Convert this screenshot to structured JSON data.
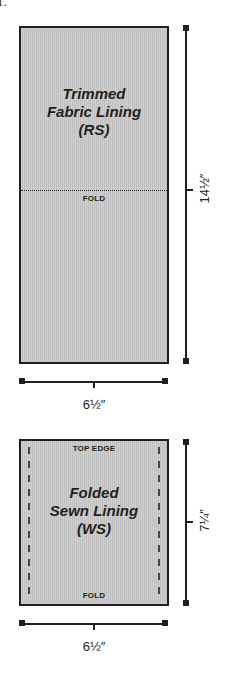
{
  "corner_fragment": "1.",
  "top_panel": {
    "title_lines": [
      "Trimmed",
      "Fabric Lining",
      "(RS)"
    ],
    "fold_label": "FOLD",
    "fill_color": "#c9c9c9",
    "border_color": "#231f20"
  },
  "top_dimensions": {
    "height_label": "14½″",
    "width_label": "6½″"
  },
  "bottom_panel": {
    "title_lines": [
      "Folded",
      "Sewn Lining",
      "(WS)"
    ],
    "top_label": "TOP EDGE",
    "bottom_label": "FOLD",
    "fill_color": "#c9c9c9",
    "border_color": "#231f20"
  },
  "bottom_dimensions": {
    "height_label": "7¼″",
    "width_label": "6½″"
  }
}
